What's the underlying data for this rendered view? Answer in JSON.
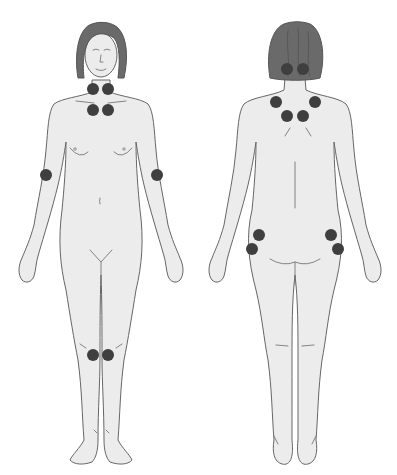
{
  "diagram": {
    "title": "",
    "colors": {
      "background": "#ffffff",
      "skin": "#ececec",
      "outline": "#666666",
      "hair": "#6a6a6a",
      "tender_point": "#3f3f3f"
    },
    "dot_diameter": 12,
    "figures": [
      {
        "id": "front",
        "view": "front",
        "points": [
          {
            "name": "neck-left",
            "x": 93,
            "y": 89
          },
          {
            "name": "neck-right",
            "x": 108,
            "y": 89
          },
          {
            "name": "chest-left",
            "x": 93,
            "y": 110
          },
          {
            "name": "chest-right",
            "x": 108,
            "y": 110
          },
          {
            "name": "elbow-left",
            "x": 46,
            "y": 175
          },
          {
            "name": "elbow-right",
            "x": 157,
            "y": 175
          },
          {
            "name": "knee-left",
            "x": 93,
            "y": 355
          },
          {
            "name": "knee-right",
            "x": 108,
            "y": 355
          }
        ]
      },
      {
        "id": "back",
        "view": "back",
        "points": [
          {
            "name": "occiput-left",
            "x": 287,
            "y": 69
          },
          {
            "name": "occiput-right",
            "x": 303,
            "y": 69
          },
          {
            "name": "shoulder-left",
            "x": 276,
            "y": 102
          },
          {
            "name": "shoulder-right",
            "x": 315,
            "y": 102
          },
          {
            "name": "upper-back-left",
            "x": 287,
            "y": 116
          },
          {
            "name": "upper-back-right",
            "x": 303,
            "y": 116
          },
          {
            "name": "hip-upper-left",
            "x": 259,
            "y": 235
          },
          {
            "name": "hip-upper-right",
            "x": 331,
            "y": 235
          },
          {
            "name": "hip-lower-left",
            "x": 252,
            "y": 249
          },
          {
            "name": "hip-lower-right",
            "x": 338,
            "y": 249
          }
        ]
      }
    ]
  }
}
